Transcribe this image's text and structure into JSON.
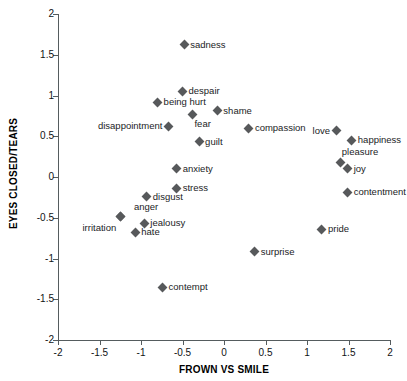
{
  "chart_data": {
    "type": "scatter",
    "title": "",
    "xlabel": "FROWN VS SMILE",
    "ylabel": "EYES CLOSED/TEARS",
    "xlim": [
      -2,
      2
    ],
    "ylim": [
      -2,
      2
    ],
    "xticks": [
      "-2",
      "-1.5",
      "-1",
      "-0.5",
      "0",
      "0.5",
      "1",
      "1.5",
      "2"
    ],
    "xtick_values": [
      -2,
      -1.5,
      -1,
      -0.5,
      0,
      0.5,
      1,
      1.5,
      2
    ],
    "yticks": [
      "2",
      "1.5",
      "1",
      "0.5",
      "0",
      "-0.5",
      "-1",
      "-1.5",
      "-2"
    ],
    "ytick_values": [
      2,
      1.5,
      1,
      0.5,
      0,
      -0.5,
      -1,
      -1.5,
      -2
    ],
    "grid": false,
    "legend": null,
    "marker": "diamond",
    "marker_color": "#57595b",
    "points": [
      {
        "label": "sadness",
        "x": -0.48,
        "y": 1.62,
        "label_pos": "right"
      },
      {
        "label": "despair",
        "x": -0.5,
        "y": 1.05,
        "label_pos": "right"
      },
      {
        "label": "being hurt",
        "x": -0.8,
        "y": 0.92,
        "label_pos": "right"
      },
      {
        "label": "shame",
        "x": -0.08,
        "y": 0.81,
        "label_pos": "right"
      },
      {
        "label": "fear",
        "x": -0.38,
        "y": 0.77,
        "label_pos": "below-right"
      },
      {
        "label": "disappointment",
        "x": -0.67,
        "y": 0.62,
        "label_pos": "left"
      },
      {
        "label": "compassion",
        "x": 0.3,
        "y": 0.6,
        "label_pos": "right"
      },
      {
        "label": "love",
        "x": 1.35,
        "y": 0.57,
        "label_pos": "left"
      },
      {
        "label": "happiness",
        "x": 1.54,
        "y": 0.45,
        "label_pos": "right"
      },
      {
        "label": "guilt",
        "x": -0.3,
        "y": 0.43,
        "label_pos": "right"
      },
      {
        "label": "pleasure",
        "x": 1.4,
        "y": 0.18,
        "label_pos": "above-right"
      },
      {
        "label": "joy",
        "x": 1.49,
        "y": 0.1,
        "label_pos": "right"
      },
      {
        "label": "anxiety",
        "x": -0.57,
        "y": 0.1,
        "label_pos": "right"
      },
      {
        "label": "contentment",
        "x": 1.49,
        "y": -0.19,
        "label_pos": "right"
      },
      {
        "label": "stress",
        "x": -0.57,
        "y": -0.14,
        "label_pos": "right"
      },
      {
        "label": "disgust",
        "x": -0.93,
        "y": -0.24,
        "label_pos": "right"
      },
      {
        "label": "anger",
        "x": -1.25,
        "y": -0.49,
        "label_pos": "above-right"
      },
      {
        "label": "jealousy",
        "x": -0.96,
        "y": -0.57,
        "label_pos": "right"
      },
      {
        "label": "irritation",
        "x": -1.25,
        "y": -0.49,
        "label_pos": "below-left"
      },
      {
        "label": "pride",
        "x": 1.18,
        "y": -0.64,
        "label_pos": "right"
      },
      {
        "label": "hate",
        "x": -1.07,
        "y": -0.68,
        "label_pos": "right"
      },
      {
        "label": "surprise",
        "x": 0.37,
        "y": -0.92,
        "label_pos": "right"
      },
      {
        "label": "contempt",
        "x": -0.74,
        "y": -1.35,
        "label_pos": "right"
      }
    ]
  }
}
